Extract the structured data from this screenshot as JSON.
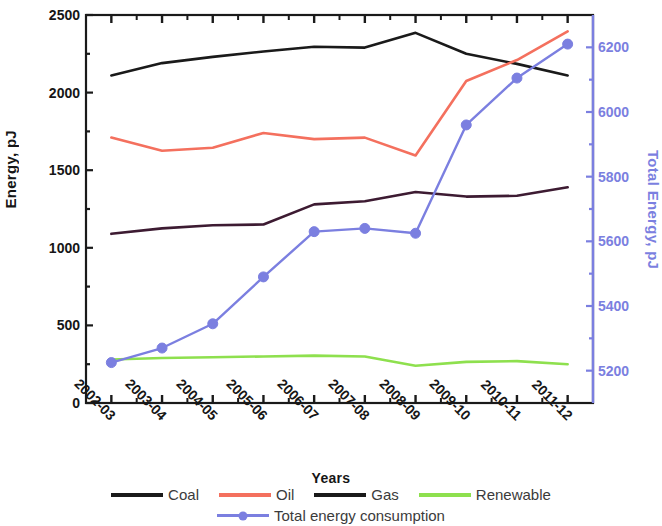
{
  "chart_data": {
    "type": "line",
    "title": "",
    "xlabel": "Years",
    "ylabel": "Energy, pJ",
    "ylabel_right": "Total Energy, pJ",
    "categories": [
      "2002-03",
      "2003-04",
      "2004-05",
      "2005-06",
      "2006-07",
      "2007-08",
      "2008-09",
      "2009-10",
      "2010-11",
      "2011-12"
    ],
    "ylim": [
      0,
      2500
    ],
    "yticks": [
      0,
      500,
      1000,
      1500,
      2000,
      2500
    ],
    "ylim_right": [
      5100,
      6300
    ],
    "yticks_right": [
      5200,
      5400,
      5600,
      5800,
      6000,
      6200
    ],
    "grid": false,
    "legend_position": "bottom",
    "series": [
      {
        "name": "Coal",
        "color": "#1a1a1a",
        "axis": "left",
        "values": [
          2110,
          2190,
          2230,
          2265,
          2295,
          2290,
          2385,
          2250,
          2185,
          2110
        ]
      },
      {
        "name": "Oil",
        "color": "#f4705e",
        "axis": "left",
        "values": [
          1710,
          1625,
          1645,
          1740,
          1700,
          1710,
          1595,
          2075,
          2210,
          2395
        ]
      },
      {
        "name": "Gas",
        "color": "#3d1b32",
        "axis": "left",
        "values": [
          1090,
          1125,
          1145,
          1150,
          1280,
          1300,
          1360,
          1330,
          1335,
          1390
        ]
      },
      {
        "name": "Renewable",
        "color": "#8ee04e",
        "axis": "left",
        "values": [
          280,
          290,
          295,
          300,
          305,
          300,
          240,
          265,
          270,
          250
        ]
      },
      {
        "name": "Total energy consumption",
        "color": "#7b7fe0",
        "axis": "right",
        "markers": true,
        "values": [
          5225,
          5270,
          5345,
          5490,
          5630,
          5640,
          5625,
          5960,
          6105,
          6210
        ]
      }
    ]
  },
  "legend": {
    "row1": [
      {
        "label": "Coal",
        "color": "#1a1a1a",
        "marker": false
      },
      {
        "label": "Oil",
        "color": "#f4705e",
        "marker": false
      },
      {
        "label": "Gas",
        "color": "#1a1a1a",
        "marker": false
      },
      {
        "label": "Renewable",
        "color": "#8ee04e",
        "marker": false
      }
    ],
    "row2": [
      {
        "label": "Total energy consumption",
        "color": "#7b7fe0",
        "marker": true
      }
    ]
  }
}
